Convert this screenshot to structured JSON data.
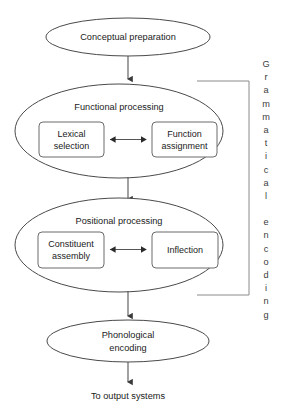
{
  "diagram": {
    "nodes": {
      "conceptual": {
        "label": "Conceptual preparation",
        "shape": "ellipse"
      },
      "functional": {
        "label": "Functional processing",
        "shape": "ellipse"
      },
      "positional": {
        "label": "Positional processing",
        "shape": "ellipse"
      },
      "phonological": {
        "label_line1": "Phonological",
        "label_line2": "encoding",
        "shape": "ellipse"
      }
    },
    "boxes": {
      "lexical": {
        "line1": "Lexical",
        "line2": "selection"
      },
      "function_assignment": {
        "line1": "Function",
        "line2": "assignment"
      },
      "constituent": {
        "line1": "Constituent",
        "line2": "assembly"
      },
      "inflection": {
        "line1": "Inflection",
        "line2": ""
      }
    },
    "bracket": {
      "label": "Grammatical encoding",
      "word1": "Grammatical",
      "word2": "encoding",
      "letters_word1": [
        "G",
        "r",
        "a",
        "m",
        "m",
        "a",
        "t",
        "i",
        "c",
        "a",
        "l"
      ],
      "letters_word2": [
        "e",
        "n",
        "c",
        "o",
        "d",
        "i",
        "n",
        "g"
      ]
    },
    "output": {
      "label": "To output systems"
    },
    "colors": {
      "background": "#ffffff",
      "ellipse_stroke": "#4a4a4a",
      "box_stroke": "#6b6b6b",
      "arrow": "#555555",
      "bracket": "#8a8a8a",
      "text": "#1a1a1a"
    }
  }
}
